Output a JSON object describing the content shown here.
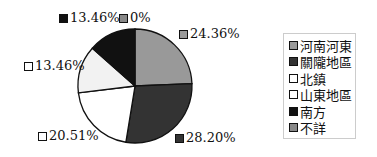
{
  "chart_data": {
    "type": "pie",
    "title": "",
    "categories": [
      "河南河東",
      "關隴地區",
      "北鎮",
      "山東地區",
      "南方",
      "不詳"
    ],
    "values": [
      24.36,
      28.2,
      20.51,
      13.46,
      13.46,
      0
    ],
    "labels": [
      "24.36%",
      "28.20%",
      "20.51%",
      "13.46%",
      "13.46%",
      "0%"
    ],
    "colors": [
      "#999999",
      "#333333",
      "#ffffff",
      "#f2f2f2",
      "#111111",
      "#888888"
    ],
    "start_angle": "top (12 o'clock)",
    "direction": "clockwise",
    "legend_position": "right"
  },
  "labels": {
    "henan": "24.36%",
    "guanlong": "28.20%",
    "beizhen": "20.51%",
    "shandong": "13.46%",
    "nanfang": "13.46%",
    "buxiang": "0%"
  },
  "legend": {
    "items": [
      "河南河東",
      "關隴地區",
      "北鎮",
      "山東地區",
      "南方",
      "不詳"
    ]
  }
}
